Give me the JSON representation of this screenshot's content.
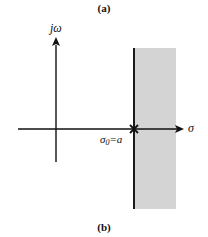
{
  "figure": {
    "top_caption": "(a)",
    "bottom_caption": "(b)",
    "imag_axis_label": "jω",
    "real_axis_label": "σ",
    "pole_label_symbol": "σ",
    "pole_label_subscript": "0",
    "pole_label_rest": "=a",
    "pole_marker": "×",
    "colors": {
      "axis": "#111111",
      "roc_fill": "#d4d4d4",
      "roc_boundary": "#1a1a1a",
      "background": "#ffffff"
    }
  },
  "diagram": {
    "type": "s-plane region of convergence",
    "origin": {
      "x": 56,
      "y": 129
    },
    "pole": {
      "x": 134,
      "y": 129,
      "marker": "cross"
    },
    "roc": {
      "x_start": 134,
      "x_end": 176,
      "y_start": 48,
      "y_end": 209,
      "side": "right of pole"
    }
  }
}
